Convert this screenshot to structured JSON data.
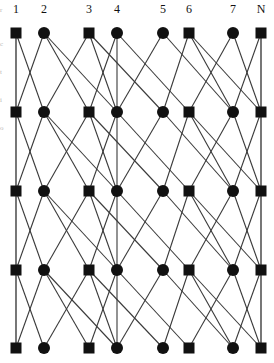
{
  "figure": {
    "title": "",
    "type": "multistage-interconnection-network",
    "width": 274,
    "height": 363,
    "background": "#ffffff",
    "node_color": "#111111",
    "edge_color": "#3a3a3a",
    "vertical_line_color": "#9a9a9a"
  },
  "column_labels": [
    {
      "text": "1",
      "x": 16
    },
    {
      "text": "2",
      "x": 44
    },
    {
      "text": "3",
      "x": 89
    },
    {
      "text": "4",
      "x": 117
    },
    {
      "text": "5",
      "x": 163
    },
    {
      "text": "6",
      "x": 189
    },
    {
      "text": "7",
      "x": 233
    },
    {
      "text": "N",
      "x": 261
    }
  ],
  "side_marks": [
    {
      "text": "r",
      "y": 6
    },
    {
      "text": "c",
      "y": 40
    },
    {
      "text": "t",
      "y": 68
    },
    {
      "text": "i",
      "y": 96
    },
    {
      "text": "o",
      "y": 124
    }
  ],
  "graph": {
    "columns_x": [
      16,
      44,
      89,
      117,
      163,
      189,
      233,
      261
    ],
    "rows_y": [
      33,
      112,
      191,
      270,
      348
    ],
    "node_shapes": [
      "square",
      "circle",
      "square",
      "circle",
      "circle",
      "square",
      "circle",
      "square"
    ],
    "square_size": 11,
    "circle_radius": 6,
    "stages": [
      {
        "from_row": 0,
        "to_row": 1,
        "edges": [
          [
            0,
            0
          ],
          [
            0,
            1
          ],
          [
            1,
            0
          ],
          [
            1,
            2
          ],
          [
            1,
            3
          ],
          [
            2,
            1
          ],
          [
            2,
            4
          ],
          [
            3,
            2
          ],
          [
            3,
            3
          ],
          [
            3,
            5
          ],
          [
            4,
            3
          ],
          [
            4,
            6
          ],
          [
            5,
            4
          ],
          [
            5,
            7
          ],
          [
            6,
            5
          ],
          [
            6,
            7
          ],
          [
            7,
            6
          ],
          [
            7,
            7
          ],
          [
            2,
            3
          ],
          [
            5,
            6
          ]
        ]
      },
      {
        "from_row": 1,
        "to_row": 2,
        "edges": [
          [
            0,
            0
          ],
          [
            0,
            1
          ],
          [
            1,
            0
          ],
          [
            1,
            2
          ],
          [
            1,
            3
          ],
          [
            2,
            1
          ],
          [
            2,
            4
          ],
          [
            3,
            2
          ],
          [
            3,
            3
          ],
          [
            3,
            5
          ],
          [
            4,
            3
          ],
          [
            4,
            6
          ],
          [
            5,
            4
          ],
          [
            5,
            7
          ],
          [
            6,
            5
          ],
          [
            6,
            7
          ],
          [
            7,
            6
          ],
          [
            7,
            7
          ],
          [
            2,
            3
          ],
          [
            5,
            6
          ]
        ]
      },
      {
        "from_row": 2,
        "to_row": 3,
        "edges": [
          [
            0,
            0
          ],
          [
            0,
            1
          ],
          [
            1,
            0
          ],
          [
            1,
            2
          ],
          [
            1,
            3
          ],
          [
            2,
            1
          ],
          [
            2,
            4
          ],
          [
            3,
            2
          ],
          [
            3,
            3
          ],
          [
            3,
            5
          ],
          [
            4,
            3
          ],
          [
            4,
            6
          ],
          [
            5,
            4
          ],
          [
            5,
            7
          ],
          [
            6,
            5
          ],
          [
            6,
            7
          ],
          [
            7,
            6
          ],
          [
            7,
            7
          ],
          [
            2,
            3
          ],
          [
            5,
            6
          ]
        ]
      },
      {
        "from_row": 3,
        "to_row": 4,
        "edges": [
          [
            0,
            0
          ],
          [
            0,
            1
          ],
          [
            1,
            0
          ],
          [
            1,
            2
          ],
          [
            1,
            3
          ],
          [
            2,
            1
          ],
          [
            2,
            4
          ],
          [
            3,
            2
          ],
          [
            3,
            3
          ],
          [
            3,
            5
          ],
          [
            4,
            3
          ],
          [
            4,
            6
          ],
          [
            5,
            4
          ],
          [
            5,
            7
          ],
          [
            6,
            5
          ],
          [
            6,
            7
          ],
          [
            7,
            6
          ],
          [
            7,
            7
          ],
          [
            2,
            3
          ],
          [
            5,
            6
          ]
        ]
      }
    ],
    "vertical_rails": [
      0,
      7
    ]
  },
  "watermark": ""
}
